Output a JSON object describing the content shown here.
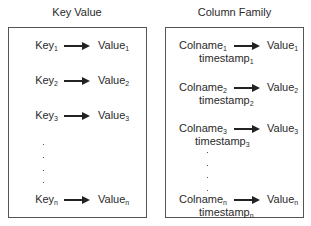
{
  "diagram": {
    "left_panel": {
      "title": "Key Value",
      "rows": [
        {
          "key": "Key",
          "key_sub": "1",
          "value": "Value",
          "value_sub": "1"
        },
        {
          "key": "Key",
          "key_sub": "2",
          "value": "Value",
          "value_sub": "2"
        },
        {
          "key": "Key",
          "key_sub": "3",
          "value": "Value",
          "value_sub": "3"
        },
        {
          "key": "Key",
          "key_sub": "n",
          "value": "Value",
          "value_sub": "n"
        }
      ],
      "ellipsis": "⋮"
    },
    "right_panel": {
      "title": "Column Family",
      "rows": [
        {
          "key": "Colname",
          "key_sub": "1",
          "value": "Value",
          "value_sub": "1",
          "timestamp": "timestamp",
          "timestamp_sub": "1"
        },
        {
          "key": "Colname",
          "key_sub": "2",
          "value": "Value",
          "value_sub": "2",
          "timestamp": "timestamp",
          "timestamp_sub": "2"
        },
        {
          "key": "Colname",
          "key_sub": "3",
          "value": "Value",
          "value_sub": "3",
          "timestamp": "timestamp",
          "timestamp_sub": "3"
        },
        {
          "key": "Colname",
          "key_sub": "n",
          "value": "Value",
          "value_sub": "n",
          "timestamp": "timestamp",
          "timestamp_sub": "n"
        }
      ],
      "ellipsis": "⋮"
    },
    "colors": {
      "border": "#555555",
      "text": "#2a2a2a",
      "arrow": "#222222"
    }
  }
}
